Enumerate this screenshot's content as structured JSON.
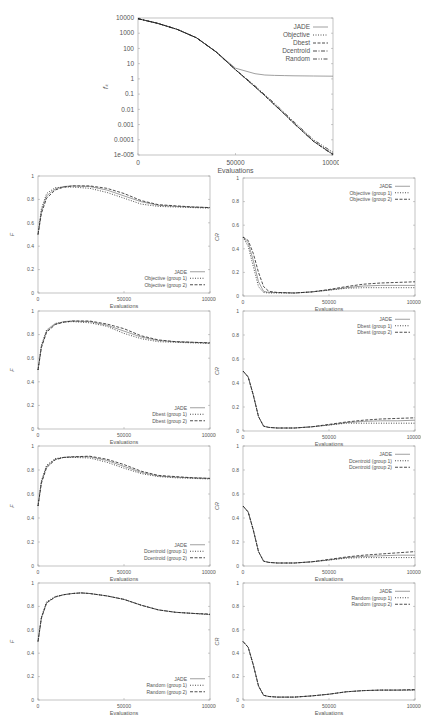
{
  "figure": {
    "top_plot": {
      "ylabel": "f_k",
      "xlabel": "Evaluations"
    }
  },
  "chart_data": [
    {
      "id": "top",
      "type": "line",
      "title": "",
      "xlabel": "Evaluations",
      "ylabel": "f_k",
      "yscale": "log",
      "xlim": [
        0,
        100000
      ],
      "ylim": [
        1e-05,
        10000
      ],
      "xticks": [
        "0",
        "50000",
        "100000"
      ],
      "yticks": [
        "1e-005",
        "0.0001",
        "0.001",
        "0.01",
        "0.1",
        "1",
        "10",
        "100",
        "1000",
        "10000"
      ],
      "legend_position": "upper right",
      "x": [
        0,
        10000,
        20000,
        30000,
        40000,
        50000,
        60000,
        65000,
        70000,
        75000,
        80000,
        90000,
        100000
      ],
      "series": [
        {
          "name": "JADE",
          "style": "solid",
          "values": [
            9000,
            4500,
            1800,
            500,
            60,
            5,
            2.2,
            1.8,
            1.7,
            1.65,
            1.6,
            1.55,
            1.5
          ]
        },
        {
          "name": "Objective",
          "style": "dotted",
          "values": [
            9000,
            4500,
            1800,
            500,
            60,
            4,
            0.3,
            0.08,
            0.02,
            0.005,
            0.0012,
            8e-05,
            1.2e-05
          ]
        },
        {
          "name": "Dbest",
          "style": "dashed",
          "values": [
            9000,
            4500,
            1800,
            500,
            60,
            4,
            0.3,
            0.08,
            0.02,
            0.005,
            0.0012,
            8e-05,
            1.1e-05
          ]
        },
        {
          "name": "Dcentroid",
          "style": "dashdot",
          "values": [
            9000,
            4500,
            1800,
            500,
            60,
            4,
            0.3,
            0.08,
            0.02,
            0.005,
            0.0012,
            8e-05,
            1e-05
          ]
        },
        {
          "name": "Random",
          "style": "dashdotdot",
          "values": [
            9000,
            4500,
            1800,
            500,
            60,
            4,
            0.35,
            0.09,
            0.025,
            0.006,
            0.0015,
            0.0001,
            1.5e-05
          ]
        }
      ]
    },
    {
      "id": "F-objective",
      "type": "line",
      "xlabel": "Evaluations",
      "ylabel": "F",
      "xlim": [
        0,
        100000
      ],
      "ylim": [
        0,
        1
      ],
      "xticks": [
        "0",
        "50000",
        "100000"
      ],
      "yticks": [
        "0",
        "0.2",
        "0.4",
        "0.6",
        "0.8",
        "1"
      ],
      "legend_position": "lower right",
      "x": [
        0,
        2000,
        5000,
        10000,
        15000,
        20000,
        30000,
        40000,
        50000,
        60000,
        70000,
        80000,
        90000,
        100000
      ],
      "series": [
        {
          "name": "JADE",
          "style": "solid",
          "values": [
            0.5,
            0.7,
            0.83,
            0.89,
            0.91,
            0.915,
            0.91,
            0.88,
            0.83,
            0.78,
            0.75,
            0.74,
            0.735,
            0.73
          ]
        },
        {
          "name": "Objective (group 1)",
          "style": "dotted",
          "values": [
            0.5,
            0.72,
            0.85,
            0.9,
            0.905,
            0.905,
            0.895,
            0.86,
            0.81,
            0.76,
            0.74,
            0.735,
            0.73,
            0.725
          ]
        },
        {
          "name": "Objective (group 2)",
          "style": "dashed",
          "values": [
            0.5,
            0.68,
            0.81,
            0.88,
            0.905,
            0.915,
            0.915,
            0.895,
            0.85,
            0.79,
            0.755,
            0.745,
            0.735,
            0.73
          ]
        }
      ]
    },
    {
      "id": "CR-objective",
      "type": "line",
      "xlabel": "Evaluations",
      "ylabel": "CR",
      "xlim": [
        0,
        100000
      ],
      "ylim": [
        0,
        1
      ],
      "xticks": [
        "0",
        "50000",
        "100000"
      ],
      "yticks": [
        "0",
        "0.2",
        "0.4",
        "0.6",
        "0.8",
        "1"
      ],
      "legend_position": "upper right",
      "x": [
        0,
        3000,
        6000,
        9000,
        12000,
        15000,
        20000,
        30000,
        40000,
        50000,
        60000,
        70000,
        80000,
        90000,
        100000
      ],
      "series": [
        {
          "name": "JADE",
          "style": "solid",
          "values": [
            0.5,
            0.45,
            0.3,
            0.12,
            0.04,
            0.03,
            0.03,
            0.025,
            0.035,
            0.05,
            0.07,
            0.085,
            0.09,
            0.09,
            0.09
          ]
        },
        {
          "name": "Objective (group 1)",
          "style": "dotted",
          "values": [
            0.5,
            0.42,
            0.25,
            0.08,
            0.03,
            0.025,
            0.025,
            0.025,
            0.035,
            0.05,
            0.065,
            0.07,
            0.07,
            0.07,
            0.07
          ]
        },
        {
          "name": "Objective (group 2)",
          "style": "dashed",
          "values": [
            0.5,
            0.47,
            0.36,
            0.2,
            0.08,
            0.04,
            0.03,
            0.025,
            0.035,
            0.055,
            0.08,
            0.1,
            0.11,
            0.115,
            0.12
          ]
        }
      ]
    },
    {
      "id": "F-dbest",
      "type": "line",
      "xlabel": "Evaluations",
      "ylabel": "F",
      "xlim": [
        0,
        100000
      ],
      "ylim": [
        0,
        1
      ],
      "xticks": [
        "0",
        "50000",
        "100000"
      ],
      "yticks": [
        "0",
        "0.2",
        "0.4",
        "0.6",
        "0.8",
        "1"
      ],
      "legend_position": "lower right",
      "x": [
        0,
        2000,
        5000,
        10000,
        15000,
        20000,
        30000,
        40000,
        50000,
        60000,
        70000,
        80000,
        90000,
        100000
      ],
      "series": [
        {
          "name": "JADE",
          "style": "solid",
          "values": [
            0.5,
            0.7,
            0.83,
            0.89,
            0.91,
            0.915,
            0.91,
            0.88,
            0.83,
            0.78,
            0.75,
            0.74,
            0.735,
            0.73
          ]
        },
        {
          "name": "Dbest (group 1)",
          "style": "dotted",
          "values": [
            0.5,
            0.71,
            0.84,
            0.895,
            0.905,
            0.91,
            0.9,
            0.87,
            0.81,
            0.765,
            0.74,
            0.735,
            0.73,
            0.725
          ]
        },
        {
          "name": "Dbest (group 2)",
          "style": "dashed",
          "values": [
            0.5,
            0.69,
            0.82,
            0.885,
            0.905,
            0.915,
            0.915,
            0.89,
            0.85,
            0.79,
            0.755,
            0.74,
            0.735,
            0.73
          ]
        }
      ]
    },
    {
      "id": "CR-dbest",
      "type": "line",
      "xlabel": "Evaluations",
      "ylabel": "CR",
      "xlim": [
        0,
        100000
      ],
      "ylim": [
        0,
        1
      ],
      "xticks": [
        "0",
        "50000",
        "100000"
      ],
      "yticks": [
        "0",
        "0.2",
        "0.4",
        "0.6",
        "0.8",
        "1"
      ],
      "legend_position": "upper right",
      "x": [
        0,
        3000,
        6000,
        9000,
        12000,
        15000,
        20000,
        30000,
        40000,
        50000,
        60000,
        70000,
        80000,
        90000,
        100000
      ],
      "series": [
        {
          "name": "JADE",
          "style": "solid",
          "values": [
            0.5,
            0.45,
            0.3,
            0.12,
            0.04,
            0.03,
            0.025,
            0.025,
            0.035,
            0.05,
            0.07,
            0.08,
            0.085,
            0.085,
            0.09
          ]
        },
        {
          "name": "Dbest (group 1)",
          "style": "dotted",
          "values": [
            0.5,
            0.45,
            0.3,
            0.12,
            0.04,
            0.03,
            0.025,
            0.025,
            0.035,
            0.05,
            0.065,
            0.065,
            0.065,
            0.065,
            0.065
          ]
        },
        {
          "name": "Dbest (group 2)",
          "style": "dashed",
          "values": [
            0.5,
            0.45,
            0.3,
            0.12,
            0.04,
            0.03,
            0.025,
            0.025,
            0.035,
            0.055,
            0.075,
            0.09,
            0.1,
            0.105,
            0.11
          ]
        }
      ]
    },
    {
      "id": "F-dcentroid",
      "type": "line",
      "xlabel": "Evaluations",
      "ylabel": "F",
      "xlim": [
        0,
        100000
      ],
      "ylim": [
        0,
        1
      ],
      "xticks": [
        "0",
        "50000",
        "100000"
      ],
      "yticks": [
        "0",
        "0.2",
        "0.4",
        "0.6",
        "0.8",
        "1"
      ],
      "legend_position": "lower right",
      "x": [
        0,
        2000,
        5000,
        10000,
        15000,
        20000,
        30000,
        40000,
        50000,
        60000,
        70000,
        80000,
        90000,
        100000
      ],
      "series": [
        {
          "name": "JADE",
          "style": "solid",
          "values": [
            0.5,
            0.7,
            0.83,
            0.89,
            0.905,
            0.91,
            0.91,
            0.88,
            0.83,
            0.78,
            0.75,
            0.74,
            0.735,
            0.73
          ]
        },
        {
          "name": "Dcentroid (group 1)",
          "style": "dotted",
          "values": [
            0.5,
            0.71,
            0.84,
            0.895,
            0.905,
            0.905,
            0.9,
            0.865,
            0.815,
            0.77,
            0.745,
            0.735,
            0.73,
            0.725
          ]
        },
        {
          "name": "Dcentroid (group 2)",
          "style": "dashed",
          "values": [
            0.5,
            0.69,
            0.82,
            0.885,
            0.905,
            0.91,
            0.915,
            0.89,
            0.845,
            0.79,
            0.755,
            0.745,
            0.735,
            0.73
          ]
        }
      ]
    },
    {
      "id": "CR-dcentroid",
      "type": "line",
      "xlabel": "Evaluations",
      "ylabel": "CR",
      "xlim": [
        0,
        100000
      ],
      "ylim": [
        0,
        1
      ],
      "xticks": [
        "0",
        "50000",
        "100000"
      ],
      "yticks": [
        "0",
        "0.2",
        "0.4",
        "0.6",
        "0.8",
        "1"
      ],
      "legend_position": "upper right",
      "x": [
        0,
        3000,
        6000,
        9000,
        12000,
        15000,
        20000,
        30000,
        40000,
        50000,
        60000,
        70000,
        80000,
        90000,
        100000
      ],
      "series": [
        {
          "name": "JADE",
          "style": "solid",
          "values": [
            0.5,
            0.45,
            0.3,
            0.12,
            0.04,
            0.03,
            0.025,
            0.025,
            0.035,
            0.05,
            0.07,
            0.08,
            0.085,
            0.09,
            0.09
          ]
        },
        {
          "name": "Dcentroid (group 1)",
          "style": "dotted",
          "values": [
            0.5,
            0.45,
            0.3,
            0.12,
            0.04,
            0.03,
            0.025,
            0.025,
            0.035,
            0.05,
            0.065,
            0.07,
            0.07,
            0.07,
            0.07
          ]
        },
        {
          "name": "Dcentroid (group 2)",
          "style": "dashed",
          "values": [
            0.5,
            0.45,
            0.3,
            0.12,
            0.04,
            0.03,
            0.025,
            0.025,
            0.035,
            0.055,
            0.075,
            0.09,
            0.1,
            0.11,
            0.12
          ]
        }
      ]
    },
    {
      "id": "F-random",
      "type": "line",
      "xlabel": "Evaluations",
      "ylabel": "F",
      "xlim": [
        0,
        100000
      ],
      "ylim": [
        0,
        1
      ],
      "xticks": [
        "0",
        "50000",
        "100000"
      ],
      "yticks": [
        "0",
        "0.2",
        "0.4",
        "0.6",
        "0.8",
        "1"
      ],
      "legend_position": "lower right",
      "x": [
        0,
        2000,
        5000,
        10000,
        15000,
        20000,
        25000,
        30000,
        40000,
        50000,
        60000,
        70000,
        80000,
        90000,
        100000
      ],
      "series": [
        {
          "name": "JADE",
          "style": "solid",
          "values": [
            0.5,
            0.7,
            0.83,
            0.88,
            0.9,
            0.91,
            0.915,
            0.91,
            0.89,
            0.86,
            0.81,
            0.77,
            0.75,
            0.74,
            0.73
          ]
        },
        {
          "name": "Random (group 1)",
          "style": "dotted",
          "values": [
            0.5,
            0.71,
            0.84,
            0.885,
            0.9,
            0.91,
            0.915,
            0.91,
            0.89,
            0.86,
            0.81,
            0.77,
            0.75,
            0.74,
            0.73
          ]
        },
        {
          "name": "Random (group 2)",
          "style": "dashed",
          "values": [
            0.5,
            0.7,
            0.83,
            0.88,
            0.9,
            0.91,
            0.915,
            0.91,
            0.89,
            0.86,
            0.81,
            0.77,
            0.75,
            0.74,
            0.735
          ]
        }
      ]
    },
    {
      "id": "CR-random",
      "type": "line",
      "xlabel": "Evaluations",
      "ylabel": "CR",
      "xlim": [
        0,
        100000
      ],
      "ylim": [
        0,
        1
      ],
      "xticks": [
        "0",
        "50000",
        "100000"
      ],
      "yticks": [
        "0",
        "0.2",
        "0.4",
        "0.6",
        "0.8",
        "1"
      ],
      "legend_position": "upper right",
      "x": [
        0,
        3000,
        6000,
        9000,
        12000,
        15000,
        20000,
        30000,
        40000,
        50000,
        60000,
        70000,
        80000,
        90000,
        100000
      ],
      "series": [
        {
          "name": "JADE",
          "style": "solid",
          "values": [
            0.5,
            0.45,
            0.3,
            0.12,
            0.04,
            0.03,
            0.025,
            0.025,
            0.035,
            0.05,
            0.07,
            0.08,
            0.085,
            0.085,
            0.085
          ]
        },
        {
          "name": "Random (group 1)",
          "style": "dotted",
          "values": [
            0.5,
            0.45,
            0.3,
            0.12,
            0.04,
            0.03,
            0.025,
            0.025,
            0.035,
            0.05,
            0.07,
            0.08,
            0.085,
            0.085,
            0.085
          ]
        },
        {
          "name": "Random (group 2)",
          "style": "dashed",
          "values": [
            0.5,
            0.45,
            0.3,
            0.12,
            0.04,
            0.03,
            0.025,
            0.025,
            0.035,
            0.05,
            0.07,
            0.08,
            0.085,
            0.085,
            0.09
          ]
        }
      ]
    }
  ],
  "layout": {
    "panels": [
      {
        "chart": 0,
        "left": 138,
        "top": 18,
        "width": 195,
        "height": 137,
        "label_fontsize": 6.5
      },
      {
        "chart": 1,
        "left": 38,
        "top": 176,
        "width": 172,
        "height": 117,
        "label_fontsize": 5
      },
      {
        "chart": 2,
        "left": 243,
        "top": 178,
        "width": 172,
        "height": 118,
        "label_fontsize": 5
      },
      {
        "chart": 3,
        "left": 38,
        "top": 311,
        "width": 172,
        "height": 118,
        "label_fontsize": 5
      },
      {
        "chart": 4,
        "left": 243,
        "top": 311,
        "width": 172,
        "height": 120,
        "label_fontsize": 5
      },
      {
        "chart": 5,
        "left": 38,
        "top": 446,
        "width": 172,
        "height": 120,
        "label_fontsize": 5
      },
      {
        "chart": 6,
        "left": 243,
        "top": 446,
        "width": 172,
        "height": 120,
        "label_fontsize": 5
      },
      {
        "chart": 7,
        "left": 38,
        "top": 583,
        "width": 172,
        "height": 117,
        "label_fontsize": 5
      },
      {
        "chart": 8,
        "left": 243,
        "top": 583,
        "width": 172,
        "height": 117,
        "label_fontsize": 5
      }
    ],
    "colors": {
      "axis": "#999999",
      "line": "#222222",
      "jade_line": "#888888",
      "text": "#555555"
    }
  }
}
